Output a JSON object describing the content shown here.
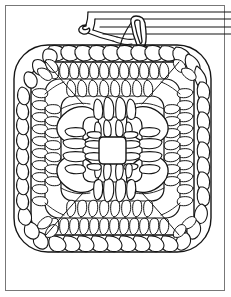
{
  "page": {
    "background_color": "#ffffff",
    "ink_color": "#151515",
    "border_color": "#777777",
    "width": 231,
    "height": 297,
    "caption": ""
  },
  "border": {
    "name": "page-frame",
    "left": 5,
    "top": 5,
    "width": 220,
    "height": 286,
    "stroke_width": 1
  },
  "artwork": {
    "subject": "crochet granny square with crochet hook",
    "style": "black and white line art coloring page",
    "square": {
      "name": "granny-square",
      "left": 14,
      "top": 45,
      "right": 211,
      "bottom": 252,
      "corner_radius": 34,
      "rounds": 5
    },
    "hook": {
      "name": "crochet-hook",
      "head_x": 84,
      "head_y": 24,
      "shaft_top_y": 12,
      "shaft_right_x": 231,
      "loop_x": 141,
      "loop_y": 24
    },
    "center": {
      "name": "center-hole",
      "cx": 112,
      "cy": 150,
      "size": 26
    }
  },
  "rings": [
    {
      "name": "ring-outer-braid",
      "inset": 0,
      "stitch_count": 44,
      "stitch_type": "chain-braid"
    },
    {
      "name": "ring-2",
      "inset": 19,
      "stitch_count": 38,
      "stitch_type": "double-crochet"
    },
    {
      "name": "ring-3",
      "inset": 36,
      "stitch_count": 32,
      "stitch_type": "double-crochet"
    },
    {
      "name": "ring-4",
      "inset": 52,
      "stitch_count": 24,
      "stitch_type": "petal"
    },
    {
      "name": "ring-inner",
      "inset": 66,
      "stitch_count": 16,
      "stitch_type": "petal"
    }
  ],
  "corner_lobes": [
    {
      "name": "corner-lobe-top-left",
      "cx": 63,
      "cy": 101
    },
    {
      "name": "corner-lobe-top-right",
      "cx": 162,
      "cy": 101
    },
    {
      "name": "corner-lobe-bottom-left",
      "cx": 63,
      "cy": 200
    },
    {
      "name": "corner-lobe-bottom-right",
      "cx": 162,
      "cy": 200
    }
  ]
}
